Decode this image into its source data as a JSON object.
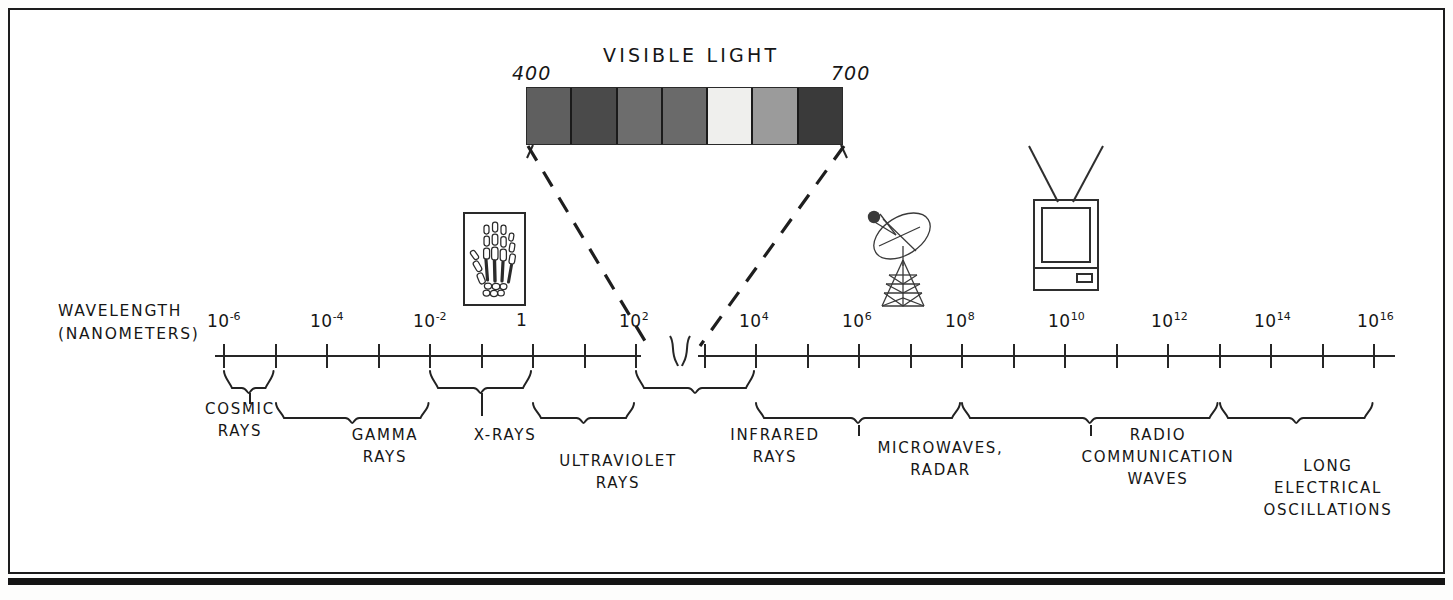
{
  "figure": {
    "kind": "electromagnetic-spectrum-diagram",
    "axis_title_line1": "WAVELENGTH",
    "axis_title_line2": "(NANOMETERS)",
    "visible_light_title": "VISIBLE LIGHT",
    "visible_range_left": "400",
    "visible_range_right": "700"
  },
  "chart_data": {
    "type": "bar",
    "title": "WAVELENGTH (NANOMETERS)",
    "subtitle": "VISIBLE LIGHT",
    "xlabel": "WAVELENGTH (NANOMETERS)",
    "ylabel": "",
    "grid": false,
    "legend": "none",
    "axis_scale": "logarithmic",
    "axis_break_after": "10^2",
    "categories": [
      "10-6",
      "10-5",
      "10-4",
      "10-3",
      "10-2",
      "10-1",
      "1",
      "10",
      "10^2",
      "10^3",
      "10^4",
      "10^5",
      "10^6",
      "10^7",
      "10^8",
      "10^9",
      "10^10",
      "10^11",
      "10^12",
      "10^13",
      "10^14",
      "10^15",
      "10^16"
    ],
    "tick_labels": [
      {
        "mantissa": "10",
        "exponent": "-6",
        "index": 0
      },
      {
        "mantissa": "10",
        "exponent": "-4",
        "index": 2
      },
      {
        "mantissa": "10",
        "exponent": "-2",
        "index": 4
      },
      {
        "mantissa": "1",
        "exponent": "",
        "index": 6
      },
      {
        "mantissa": "10",
        "exponent": "2",
        "index": 8
      },
      {
        "mantissa": "10",
        "exponent": "4",
        "index": 10
      },
      {
        "mantissa": "10",
        "exponent": "6",
        "index": 12
      },
      {
        "mantissa": "10",
        "exponent": "8",
        "index": 14
      },
      {
        "mantissa": "10",
        "exponent": "10",
        "index": 16
      },
      {
        "mantissa": "10",
        "exponent": "12",
        "index": 18
      },
      {
        "mantissa": "10",
        "exponent": "14",
        "index": 20
      },
      {
        "mantissa": "10",
        "exponent": "16",
        "index": 22
      }
    ],
    "values": [
      1,
      1,
      1,
      1,
      1,
      1,
      1,
      1,
      1,
      1,
      1,
      1,
      1,
      1,
      1,
      1,
      1,
      1,
      1,
      1,
      1,
      1,
      1
    ],
    "bands": [
      {
        "name": "COSMIC RAYS",
        "label_line1": "COSMIC",
        "label_line2": "RAYS",
        "label_line3": "",
        "start": "10-6",
        "end": "10-5"
      },
      {
        "name": "GAMMA RAYS",
        "label_line1": "GAMMA",
        "label_line2": "RAYS",
        "label_line3": "",
        "start": "10-5",
        "end": "10-2"
      },
      {
        "name": "X-RAYS",
        "label_line1": "X-RAYS",
        "label_line2": "",
        "label_line3": "",
        "start": "10-2",
        "end": "1"
      },
      {
        "name": "ULTRAVIOLET RAYS",
        "label_line1": "ULTRAVIOLET",
        "label_line2": "RAYS",
        "label_line3": "",
        "start": "1",
        "end": "10^2"
      },
      {
        "name": "INFRARED RAYS",
        "label_line1": "INFRARED",
        "label_line2": "RAYS",
        "label_line3": "",
        "start": "10^2",
        "end": "10^4"
      },
      {
        "name": "MICROWAVES, RADAR",
        "label_line1": "MICROWAVES,",
        "label_line2": "RADAR",
        "label_line3": "",
        "start": "10^4",
        "end": "10^8"
      },
      {
        "name": "RADIO COMMUNICATION WAVES",
        "label_line1": "RADIO",
        "label_line2": "COMMUNICATION",
        "label_line3": "WAVES",
        "start": "10^8",
        "end": "10^13"
      },
      {
        "name": "LONG ELECTRICAL OSCILLATIONS",
        "label_line1": "LONG",
        "label_line2": "ELECTRICAL",
        "label_line3": "OSCILLATIONS",
        "start": "10^13",
        "end": "10^16"
      }
    ],
    "visible_light": {
      "label": "VISIBLE LIGHT",
      "left_value": "400",
      "right_value": "700",
      "units": "nanometers",
      "segments": [
        {
          "index": 0,
          "color": "#5f5f5f"
        },
        {
          "index": 1,
          "color": "#4a4a4a"
        },
        {
          "index": 2,
          "color": "#6d6d6d"
        },
        {
          "index": 3,
          "color": "#6a6a6a"
        },
        {
          "index": 4,
          "color": "#efefed"
        },
        {
          "index": 5,
          "color": "#9b9b9b"
        },
        {
          "index": 6,
          "color": "#3a3a3a"
        }
      ]
    },
    "illustrations": [
      {
        "name": "xray-hand",
        "caption": "",
        "near_band": "X-RAYS"
      },
      {
        "name": "satellite-dish",
        "caption": "",
        "near_band": "MICROWAVES, RADAR"
      },
      {
        "name": "television",
        "caption": "",
        "near_band": "RADIO COMMUNICATION WAVES"
      }
    ]
  },
  "colors": {
    "ink": "#161616",
    "line": "#262626",
    "frame": "#1c1c1c",
    "paper": "#ffffff"
  }
}
